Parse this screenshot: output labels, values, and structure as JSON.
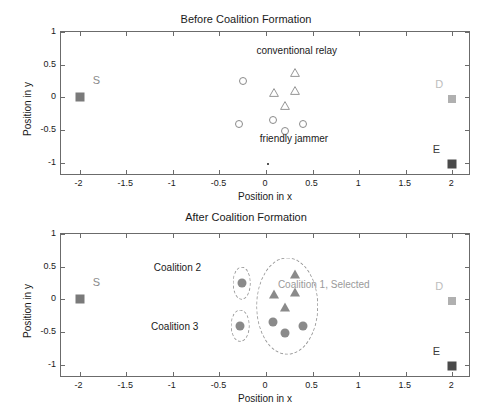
{
  "figure": {
    "width": 492,
    "height": 407,
    "background": "#ffffff"
  },
  "colors": {
    "axis": "#6b6b6b",
    "text": "#1a1a1a",
    "marker_outline": "#8a8a8a",
    "marker_fill": "#8a8a8a",
    "source_node": "#7a7a7a",
    "destination_node": "#b0b0b0",
    "eavesdropper_node": "#4a4a4a",
    "ellipse": "#9a9a9a",
    "annotation_gray": "#9a9a9a"
  },
  "axis_labels": {
    "x": "Position in x",
    "y": "Position in y"
  },
  "ticks": {
    "x": [
      "-2",
      "-1.5",
      "-1",
      "-0.5",
      "0",
      "0.5",
      "1",
      "1.5",
      "2"
    ],
    "x_values": [
      -2,
      -1.5,
      -1,
      -0.5,
      0,
      0.5,
      1,
      1.5,
      2
    ],
    "y": [
      "1",
      "0.5",
      "0",
      "-0.5",
      "-1"
    ],
    "y_values": [
      1,
      0.5,
      0,
      -0.5,
      -1
    ]
  },
  "chart_data": [
    {
      "type": "scatter",
      "title": "Before Coalition Formation",
      "xlabel": "Position in x",
      "ylabel": "Position in y",
      "xlim": [
        -2.2,
        2.2
      ],
      "ylim": [
        -1.2,
        1.0
      ],
      "grid": false,
      "legend": "none",
      "annotations": [
        {
          "text": "conventional relay",
          "x": 0.33,
          "y": 0.72,
          "color": "#1a1a1a"
        },
        {
          "text": "friendly jammer",
          "x": 0.3,
          "y": -0.62,
          "color": "#1a1a1a"
        },
        {
          "text": "S",
          "x": -1.82,
          "y": 0.26,
          "color": "#8a8a8a"
        },
        {
          "text": "D",
          "x": 1.86,
          "y": 0.2,
          "color": "#bdbdbd"
        },
        {
          "text": "E",
          "x": 1.83,
          "y": -0.78,
          "color": "#3a3a3a"
        }
      ],
      "series": [
        {
          "name": "source-node",
          "marker": "filled-square",
          "color": "#7a7a7a",
          "points": [
            {
              "x": -2.0,
              "y": 0.0
            }
          ]
        },
        {
          "name": "destination-node",
          "marker": "filled-square",
          "color": "#b0b0b0",
          "points": [
            {
              "x": 2.0,
              "y": -0.02
            }
          ]
        },
        {
          "name": "eavesdropper-node",
          "marker": "filled-square",
          "color": "#4a4a4a",
          "points": [
            {
              "x": 2.0,
              "y": -1.02
            }
          ]
        },
        {
          "name": "conventional-relay",
          "marker": "open-triangle",
          "color": "#8a8a8a",
          "points": [
            {
              "x": 0.31,
              "y": 0.39
            },
            {
              "x": 0.09,
              "y": 0.09
            },
            {
              "x": 0.31,
              "y": 0.11
            },
            {
              "x": 0.2,
              "y": -0.11
            }
          ]
        },
        {
          "name": "friendly-jammer",
          "marker": "open-circle",
          "color": "#8a8a8a",
          "points": [
            {
              "x": -0.25,
              "y": 0.25
            },
            {
              "x": -0.29,
              "y": -0.41
            },
            {
              "x": 0.08,
              "y": -0.34
            },
            {
              "x": 0.2,
              "y": -0.51
            },
            {
              "x": 0.4,
              "y": -0.41
            }
          ]
        },
        {
          "name": "stray-point",
          "marker": "dot",
          "color": "#555555",
          "points": [
            {
              "x": 0.02,
              "y": -1.02
            }
          ]
        }
      ]
    },
    {
      "type": "scatter",
      "title": "After Coalition Formation",
      "xlabel": "Position in x",
      "ylabel": "Position in y",
      "xlim": [
        -2.2,
        2.2
      ],
      "ylim": [
        -1.2,
        1.0
      ],
      "grid": false,
      "legend": "none",
      "annotations": [
        {
          "text": "Coalition 2",
          "x": -0.95,
          "y": 0.49,
          "color": "#1a1a1a"
        },
        {
          "text": "Coalition 3",
          "x": -0.98,
          "y": -0.4,
          "color": "#1a1a1a"
        },
        {
          "text": "Coalition 1, Selected",
          "x": 0.62,
          "y": 0.24,
          "color": "#9a9a9a"
        },
        {
          "text": "S",
          "x": -1.82,
          "y": 0.26,
          "color": "#8a8a8a"
        },
        {
          "text": "D",
          "x": 1.86,
          "y": 0.2,
          "color": "#bdbdbd"
        },
        {
          "text": "E",
          "x": 1.83,
          "y": -0.78,
          "color": "#3a3a3a"
        }
      ],
      "ellipses": [
        {
          "name": "coalition-1",
          "cx": 0.23,
          "cy": -0.1,
          "rx": 0.33,
          "ry": 0.74
        },
        {
          "name": "coalition-2",
          "cx": -0.26,
          "cy": 0.25,
          "rx": 0.1,
          "ry": 0.25
        },
        {
          "name": "coalition-3",
          "cx": -0.28,
          "cy": -0.4,
          "rx": 0.1,
          "ry": 0.25
        }
      ],
      "series": [
        {
          "name": "source-node",
          "marker": "filled-square",
          "color": "#7a7a7a",
          "points": [
            {
              "x": -2.0,
              "y": 0.0
            }
          ]
        },
        {
          "name": "destination-node",
          "marker": "filled-square",
          "color": "#b0b0b0",
          "points": [
            {
              "x": 2.0,
              "y": -0.02
            }
          ]
        },
        {
          "name": "eavesdropper-node",
          "marker": "filled-square",
          "color": "#4a4a4a",
          "points": [
            {
              "x": 2.0,
              "y": -1.02
            }
          ]
        },
        {
          "name": "relay",
          "marker": "filled-triangle",
          "color": "#8a8a8a",
          "points": [
            {
              "x": 0.31,
              "y": 0.39
            },
            {
              "x": 0.09,
              "y": 0.09
            },
            {
              "x": 0.31,
              "y": 0.11
            },
            {
              "x": 0.2,
              "y": -0.11
            }
          ]
        },
        {
          "name": "jammer",
          "marker": "filled-circle",
          "color": "#8a8a8a",
          "points": [
            {
              "x": -0.26,
              "y": 0.25
            },
            {
              "x": -0.28,
              "y": -0.41
            },
            {
              "x": 0.08,
              "y": -0.34
            },
            {
              "x": 0.2,
              "y": -0.51
            },
            {
              "x": 0.4,
              "y": -0.41
            }
          ]
        }
      ]
    }
  ]
}
